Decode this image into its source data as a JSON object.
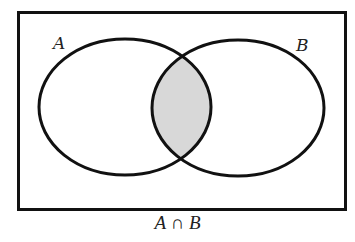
{
  "diagram": {
    "type": "venn",
    "sets": [
      {
        "label": "A"
      },
      {
        "label": "B"
      }
    ],
    "shaded_region": "intersection",
    "caption": "A ∩ B",
    "colors": {
      "stroke": "#111111",
      "shade": "#d8d8d8",
      "background": "#ffffff"
    }
  }
}
